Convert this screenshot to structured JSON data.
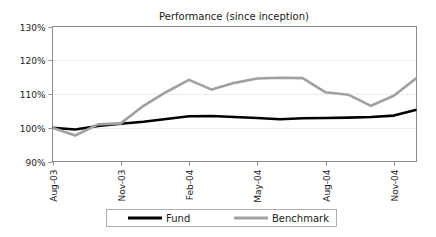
{
  "chart_data": {
    "type": "line",
    "title": "Performance (since inception)",
    "xlabel": "",
    "ylabel": "",
    "ylim": [
      90,
      130
    ],
    "ytick_values": [
      90,
      100,
      110,
      120,
      130
    ],
    "ytick_labels": [
      "90%",
      "100%",
      "110%",
      "120%",
      "130%"
    ],
    "grid": true,
    "grid_axis": "y",
    "legend_position": "bottom",
    "x": [
      "Aug-03",
      "Sep-03",
      "Oct-03",
      "Nov-03",
      "Dec-03",
      "Jan-04",
      "Feb-04",
      "Mar-04",
      "Apr-04",
      "May-04",
      "Jun-04",
      "Jul-04",
      "Aug-04",
      "Sep-04",
      "Oct-04",
      "Nov-04",
      "Dec-04"
    ],
    "xtick_labels": [
      "Aug-03",
      "Nov-03",
      "Feb-04",
      "May-04",
      "Aug-04",
      "Nov-04"
    ],
    "xtick_indices": [
      0,
      3,
      6,
      9,
      12,
      15
    ],
    "series": [
      {
        "name": "Fund",
        "color": "#000000",
        "width": 2.6,
        "values": [
          100.0,
          99.5,
          100.5,
          101.2,
          101.8,
          102.6,
          103.4,
          103.5,
          103.2,
          102.9,
          102.5,
          102.8,
          102.9,
          103.0,
          103.2,
          103.6,
          105.3
        ]
      },
      {
        "name": "Benchmark",
        "color": "#a0a0a0",
        "width": 2.6,
        "values": [
          100.0,
          97.7,
          101.0,
          101.3,
          106.5,
          110.6,
          114.2,
          111.3,
          113.3,
          114.6,
          114.8,
          114.7,
          110.5,
          109.8,
          106.5,
          109.5,
          114.7
        ]
      }
    ],
    "annotations": []
  },
  "legend": {
    "entries": [
      {
        "label": "Fund"
      },
      {
        "label": "Benchmark"
      }
    ]
  },
  "colors": {
    "fund": "#000000",
    "benchmark": "#a0a0a0",
    "axis": "#8c8c8c",
    "grid": "#e8e8e8",
    "text": "#1a1a1a",
    "background": "#ffffff"
  }
}
